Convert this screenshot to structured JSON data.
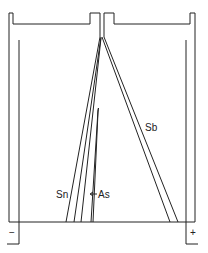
{
  "diagram": {
    "labels": {
      "sn": "Sn",
      "as": "As",
      "sb": "Sb",
      "cathode": "−",
      "anode": "+"
    },
    "colors": {
      "stroke": "#222222",
      "background": "#ffffff"
    }
  }
}
